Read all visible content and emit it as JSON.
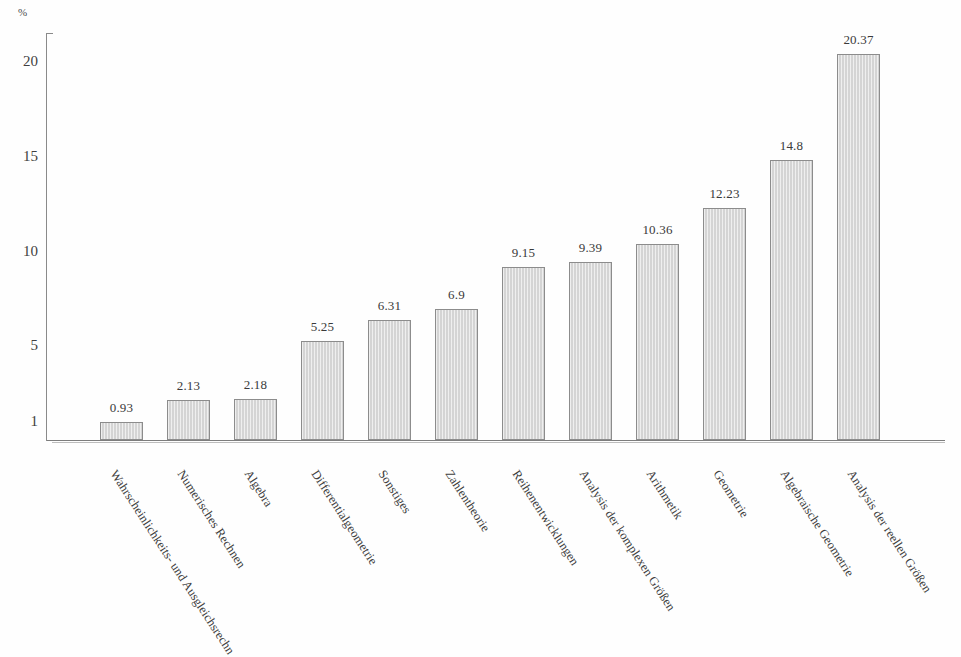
{
  "chart_data": {
    "type": "bar",
    "title": "",
    "subtitle": "",
    "xlabel": "",
    "ylabel": "%",
    "unit_label": "%",
    "ylim": [
      0,
      21.5
    ],
    "grid": false,
    "legend": "none",
    "ytick_labels": [
      "1",
      "5",
      "10",
      "15",
      "20"
    ],
    "ytick_values": [
      1,
      5,
      10,
      15,
      20
    ],
    "categories": [
      "Wahrscheinlichkeits- und Ausgleichsrechn",
      "Numerisches Rechnen",
      "Algebra",
      "Differentialgeometrie",
      "Sonstiges",
      "Zahlentheorie",
      "Reihenentwicklungen",
      "Analysis der komplexen Größen",
      "Arithmetik",
      "Geometrie",
      "Algebraische Geometrie",
      "Analysis der reellen Größen"
    ],
    "values": [
      0.93,
      2.13,
      2.18,
      5.25,
      6.31,
      6.9,
      9.15,
      9.39,
      10.36,
      12.23,
      14.8,
      20.37
    ],
    "value_labels": [
      "0.93",
      "2.13",
      "2.18",
      "5.25",
      "6.31",
      "6.9",
      "9.15",
      "9.39",
      "10.36",
      "12.23",
      "14.8",
      "20.37"
    ],
    "colors": {
      "bar_fill": "#d4d4d4",
      "bar_border": "#8c8c8c",
      "axis": "#8a8a8a",
      "text": "#3a3a3a",
      "background": "#fefefe"
    }
  }
}
